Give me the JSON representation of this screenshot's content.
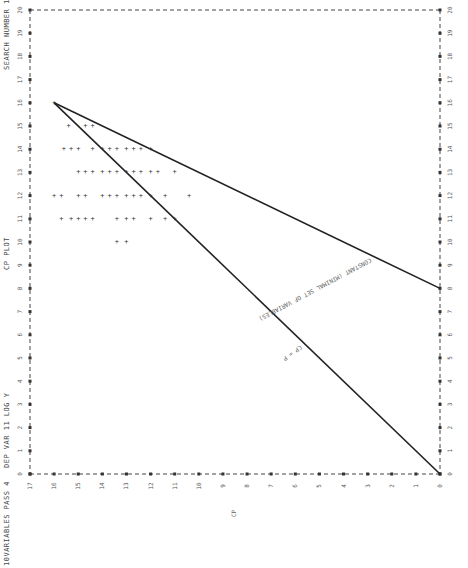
{
  "header": {
    "left_title": "10VARIABLES PASS 4",
    "dep_var": "DEP VAR 11 LOG Y",
    "plot_title": "CP PLOT",
    "search": "SEARCH NUMBER 1"
  },
  "chart_data": {
    "type": "scatter",
    "title": "CP PLOT",
    "orientation": "rotated 90deg (P axis vertical, CP axis horizontal)",
    "xlabel": "P",
    "ylabel": "CP",
    "xlim": [
      0,
      20
    ],
    "ylim": [
      0,
      17
    ],
    "p_ticks": [
      "0",
      "1",
      "2",
      "3",
      "4",
      "5",
      "6",
      "7",
      "8",
      "9",
      "10",
      "11",
      "12",
      "13",
      "14",
      "15",
      "16",
      "17",
      "18",
      "19",
      "20"
    ],
    "cp_ticks": [
      "17",
      "16",
      "15",
      "14",
      "13",
      "12",
      "11",
      "10",
      "9",
      "8",
      "7",
      "6",
      "5",
      "4",
      "3",
      "2",
      "1",
      "0"
    ],
    "grid": false,
    "series": [
      {
        "name": "subsets",
        "points": [
          {
            "p": 16,
            "cp": 16.0
          },
          {
            "p": 15,
            "cp": 15.4
          },
          {
            "p": 15,
            "cp": 14.7
          },
          {
            "p": 15,
            "cp": 14.4
          },
          {
            "p": 14,
            "cp": 15.6
          },
          {
            "p": 14,
            "cp": 15.3
          },
          {
            "p": 14,
            "cp": 15.0
          },
          {
            "p": 14,
            "cp": 14.4
          },
          {
            "p": 14,
            "cp": 14.0
          },
          {
            "p": 14,
            "cp": 13.7
          },
          {
            "p": 14,
            "cp": 13.4
          },
          {
            "p": 14,
            "cp": 13.0
          },
          {
            "p": 14,
            "cp": 12.7
          },
          {
            "p": 14,
            "cp": 12.4
          },
          {
            "p": 14,
            "cp": 12.0
          },
          {
            "p": 13,
            "cp": 15.0
          },
          {
            "p": 13,
            "cp": 14.7
          },
          {
            "p": 13,
            "cp": 14.4
          },
          {
            "p": 13,
            "cp": 14.0
          },
          {
            "p": 13,
            "cp": 13.7
          },
          {
            "p": 13,
            "cp": 13.4
          },
          {
            "p": 13,
            "cp": 13.0
          },
          {
            "p": 13,
            "cp": 12.7
          },
          {
            "p": 13,
            "cp": 12.4
          },
          {
            "p": 13,
            "cp": 12.0
          },
          {
            "p": 13,
            "cp": 11.7
          },
          {
            "p": 13,
            "cp": 11.0
          },
          {
            "p": 12,
            "cp": 16.0
          },
          {
            "p": 12,
            "cp": 15.7
          },
          {
            "p": 12,
            "cp": 15.0
          },
          {
            "p": 12,
            "cp": 14.7
          },
          {
            "p": 12,
            "cp": 14.0
          },
          {
            "p": 12,
            "cp": 13.7
          },
          {
            "p": 12,
            "cp": 13.4
          },
          {
            "p": 12,
            "cp": 13.0
          },
          {
            "p": 12,
            "cp": 12.7
          },
          {
            "p": 12,
            "cp": 12.4
          },
          {
            "p": 12,
            "cp": 12.0
          },
          {
            "p": 12,
            "cp": 11.4
          },
          {
            "p": 12,
            "cp": 10.4
          },
          {
            "p": 11,
            "cp": 15.7
          },
          {
            "p": 11,
            "cp": 15.3
          },
          {
            "p": 11,
            "cp": 15.0
          },
          {
            "p": 11,
            "cp": 14.7
          },
          {
            "p": 11,
            "cp": 14.4
          },
          {
            "p": 11,
            "cp": 13.4
          },
          {
            "p": 11,
            "cp": 13.0
          },
          {
            "p": 11,
            "cp": 12.7
          },
          {
            "p": 11,
            "cp": 12.0
          },
          {
            "p": 11,
            "cp": 11.4
          },
          {
            "p": 11,
            "cp": 11.0
          },
          {
            "p": 10,
            "cp": 13.4
          },
          {
            "p": 10,
            "cp": 13.0
          }
        ]
      }
    ],
    "reference_lines": [
      {
        "label": "CP = P",
        "from": {
          "p": 0,
          "cp": 0
        },
        "to": {
          "p": 16,
          "cp": 16
        }
      },
      {
        "label": "CONSTANT (MINIMAL SET OF VARIABLES)",
        "from": {
          "p": 8,
          "cp": 0
        },
        "to": {
          "p": 16,
          "cp": 16
        }
      }
    ],
    "annotations": [
      "CP = P",
      "CONSTANT (MINIMAL SET OF VARIABLES)"
    ]
  },
  "axis_labels": {
    "cp": "CP",
    "p": "P"
  }
}
